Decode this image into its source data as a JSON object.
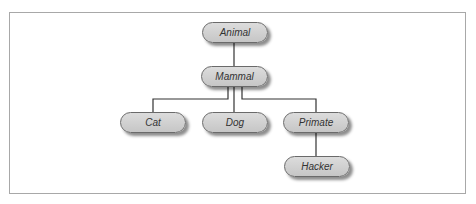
{
  "diagram": {
    "type": "inheritance-tree",
    "nodes": {
      "animal": {
        "label": "Animal"
      },
      "mammal": {
        "label": "Mammal"
      },
      "cat": {
        "label": "Cat"
      },
      "dog": {
        "label": "Dog"
      },
      "primate": {
        "label": "Primate"
      },
      "hacker": {
        "label": "Hacker"
      }
    },
    "edges": [
      {
        "from": "Animal",
        "to": "Mammal"
      },
      {
        "from": "Mammal",
        "to": "Cat"
      },
      {
        "from": "Mammal",
        "to": "Dog"
      },
      {
        "from": "Mammal",
        "to": "Primate"
      },
      {
        "from": "Primate",
        "to": "Hacker"
      }
    ],
    "colors": {
      "node_fill": "#d0d0d0",
      "node_border": "#6a6a6a",
      "edge": "#333333",
      "frame": "#a8a8a8"
    }
  }
}
